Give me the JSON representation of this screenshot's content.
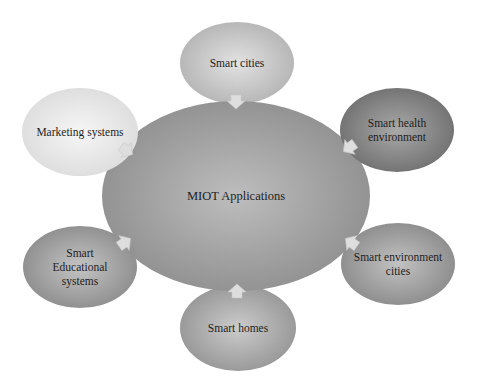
{
  "diagram": {
    "type": "hub-and-spoke",
    "center": {
      "label": "MIOT Applications",
      "shape": "ellipse",
      "cx": 236,
      "cy": 196,
      "rx": 134,
      "ry": 95,
      "fill_light": "#bdbdbd",
      "fill_dark": "#8f8f8f"
    },
    "nodes": [
      {
        "id": "smart-cities",
        "label_lines": [
          "Smart cities"
        ],
        "cx": 237,
        "cy": 63,
        "rx": 57,
        "ry": 41,
        "fill_light": "#e2e2e2",
        "fill_dark": "#b3b3b3",
        "arrow": {
          "x": 236,
          "y": 101,
          "angle": 180
        }
      },
      {
        "id": "smart-health-environment",
        "label_lines": [
          "Smart health",
          "environment"
        ],
        "cx": 397,
        "cy": 130,
        "rx": 57,
        "ry": 42,
        "fill_light": "#a9a9a9",
        "fill_dark": "#6f6f6f",
        "arrow": {
          "x": 350,
          "y": 147,
          "angle": 235
        }
      },
      {
        "id": "smart-environment-cities",
        "label_lines": [
          "Smart environment",
          "cities"
        ],
        "cx": 398,
        "cy": 264,
        "rx": 57,
        "ry": 41,
        "fill_light": "#c2c2c2",
        "fill_dark": "#8a8a8a",
        "arrow": {
          "x": 352,
          "y": 243,
          "angle": 305
        }
      },
      {
        "id": "smart-homes",
        "label_lines": [
          "Smart homes"
        ],
        "cx": 238,
        "cy": 328,
        "rx": 58,
        "ry": 43,
        "fill_light": "#cbcbcb",
        "fill_dark": "#959595",
        "arrow": {
          "x": 237,
          "y": 292,
          "angle": 0
        }
      },
      {
        "id": "smart-educational-systems",
        "label_lines": [
          "Smart",
          "Educational",
          "systems"
        ],
        "cx": 80,
        "cy": 267,
        "rx": 57,
        "ry": 41,
        "fill_light": "#c4c4c4",
        "fill_dark": "#8c8c8c",
        "arrow": {
          "x": 124,
          "y": 243,
          "angle": 55
        }
      },
      {
        "id": "marketing-systems",
        "label_lines": [
          "Marketing systems"
        ],
        "cx": 80,
        "cy": 132,
        "rx": 58,
        "ry": 44,
        "fill_light": "#f6f6f6",
        "fill_dark": "#dcdcdc",
        "arrow": {
          "x": 126,
          "y": 150,
          "angle": 125
        }
      }
    ],
    "arrow_color": "#dedede",
    "text_color": "#1e1e1e",
    "background": "#ffffff"
  }
}
